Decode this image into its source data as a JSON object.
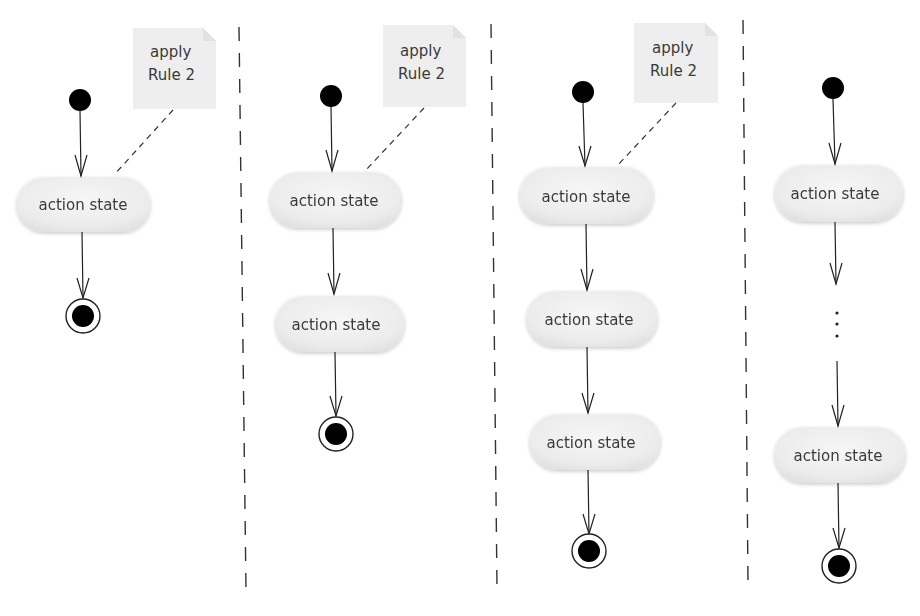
{
  "diagram": {
    "type": "uml-activity",
    "columns": [
      {
        "id": "col1",
        "note": {
          "line1": "apply",
          "line2": "Rule 2"
        },
        "action_states": [
          "action state"
        ],
        "has_ellipsis": false
      },
      {
        "id": "col2",
        "note": {
          "line1": "apply",
          "line2": "Rule 2"
        },
        "action_states": [
          "action state",
          "action state"
        ],
        "has_ellipsis": false
      },
      {
        "id": "col3",
        "note": {
          "line1": "apply",
          "line2": "Rule 2"
        },
        "action_states": [
          "action state",
          "action state",
          "action state"
        ],
        "has_ellipsis": false
      },
      {
        "id": "col4",
        "note": null,
        "action_states": [
          "action state",
          "action state"
        ],
        "has_ellipsis": true
      }
    ],
    "colors": {
      "stroke": "#222222",
      "node_fill": "#ededed",
      "note_fill": "#eeeeee",
      "text": "#3a3a3a"
    }
  }
}
